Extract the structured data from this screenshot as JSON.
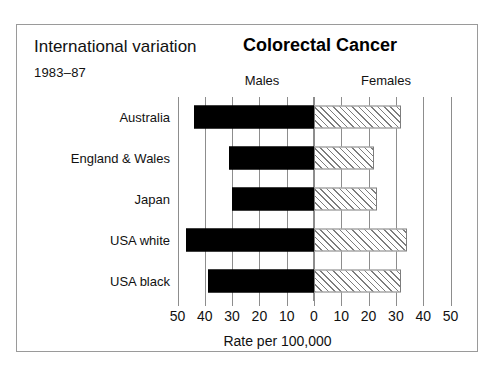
{
  "header": {
    "title_left": "International variation",
    "subtitle_left": "1983–87",
    "title_main": "Colorectal Cancer",
    "col_header_males": "Males",
    "col_header_females": "Females"
  },
  "axis": {
    "title": "Rate per 100,000",
    "tick_labels": [
      "50",
      "40",
      "30",
      "20",
      "10",
      "0",
      "10",
      "20",
      "30",
      "40",
      "50"
    ]
  },
  "chart_data": {
    "type": "bar",
    "orientation": "horizontal-diverging",
    "title": "Colorectal Cancer",
    "subtitle": "International variation 1983–87",
    "xlabel": "Rate per 100,000",
    "ylabel": "",
    "xlim": [
      -50,
      50
    ],
    "xticks": [
      -50,
      -40,
      -30,
      -20,
      -10,
      0,
      10,
      20,
      30,
      40,
      50
    ],
    "xticklabels": [
      "50",
      "40",
      "30",
      "20",
      "10",
      "0",
      "10",
      "20",
      "30",
      "40",
      "50"
    ],
    "grid": true,
    "legend": "column-headers",
    "categories": [
      "Australia",
      "England & Wales",
      "Japan",
      "USA white",
      "USA black"
    ],
    "series": [
      {
        "name": "Males",
        "side": "left",
        "color": "#000000",
        "fill": "solid",
        "values": [
          44,
          31,
          30,
          47,
          39
        ]
      },
      {
        "name": "Females",
        "side": "right",
        "color": "#ffffff",
        "fill": "diagonal-hatch",
        "values": [
          32,
          22,
          23,
          34,
          32
        ]
      }
    ]
  }
}
